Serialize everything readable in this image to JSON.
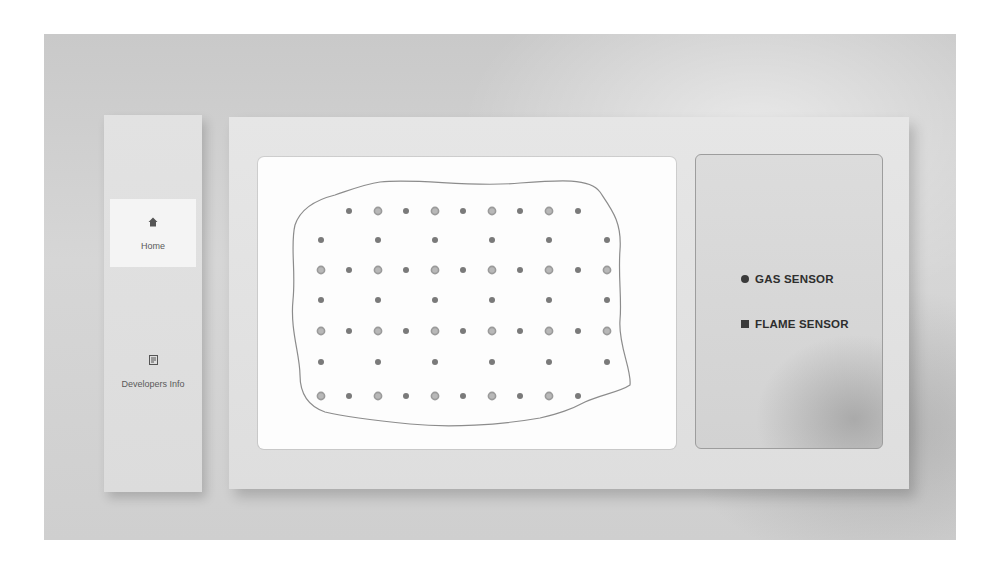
{
  "sidebar": {
    "items": [
      {
        "label": "Home",
        "icon": "home-icon",
        "glyph": "⌂",
        "active": true
      },
      {
        "label": "Developers Info",
        "icon": "document-icon",
        "glyph": "≡",
        "active": false
      }
    ]
  },
  "map": {
    "title": "",
    "boundary_color": "#8c8c8c",
    "gas_sensor_color": "#9a9a9a",
    "flame_sensor_color": "#7a7a7a",
    "rows": [
      {
        "y": 211,
        "sensors": [
          [
            "flame",
            349
          ],
          [
            "gas",
            378
          ],
          [
            "flame",
            406
          ],
          [
            "gas",
            435
          ],
          [
            "flame",
            463
          ],
          [
            "gas",
            492
          ],
          [
            "flame",
            520
          ],
          [
            "gas",
            549
          ],
          [
            "flame",
            578
          ]
        ]
      },
      {
        "y": 240,
        "sensors": [
          [
            "flame",
            321
          ],
          [
            "flame",
            378
          ],
          [
            "flame",
            435
          ],
          [
            "flame",
            492
          ],
          [
            "flame",
            549
          ],
          [
            "flame",
            607
          ]
        ]
      },
      {
        "y": 270,
        "sensors": [
          [
            "gas",
            321
          ],
          [
            "flame",
            349
          ],
          [
            "gas",
            378
          ],
          [
            "flame",
            406
          ],
          [
            "gas",
            435
          ],
          [
            "flame",
            463
          ],
          [
            "gas",
            492
          ],
          [
            "flame",
            520
          ],
          [
            "gas",
            549
          ],
          [
            "flame",
            578
          ],
          [
            "gas",
            607
          ]
        ]
      },
      {
        "y": 300,
        "sensors": [
          [
            "flame",
            321
          ],
          [
            "flame",
            378
          ],
          [
            "flame",
            435
          ],
          [
            "flame",
            492
          ],
          [
            "flame",
            549
          ],
          [
            "flame",
            607
          ]
        ]
      },
      {
        "y": 331,
        "sensors": [
          [
            "gas",
            321
          ],
          [
            "flame",
            349
          ],
          [
            "gas",
            378
          ],
          [
            "flame",
            406
          ],
          [
            "gas",
            435
          ],
          [
            "flame",
            463
          ],
          [
            "gas",
            492
          ],
          [
            "flame",
            520
          ],
          [
            "gas",
            549
          ],
          [
            "flame",
            578
          ],
          [
            "gas",
            607
          ]
        ]
      },
      {
        "y": 362,
        "sensors": [
          [
            "flame",
            321
          ],
          [
            "flame",
            378
          ],
          [
            "flame",
            435
          ],
          [
            "flame",
            492
          ],
          [
            "flame",
            549
          ],
          [
            "flame",
            607
          ]
        ]
      },
      {
        "y": 396,
        "sensors": [
          [
            "gas",
            321
          ],
          [
            "flame",
            349
          ],
          [
            "gas",
            378
          ],
          [
            "flame",
            406
          ],
          [
            "gas",
            435
          ],
          [
            "flame",
            463
          ],
          [
            "gas",
            492
          ],
          [
            "flame",
            520
          ],
          [
            "gas",
            549
          ],
          [
            "flame",
            578
          ]
        ]
      }
    ]
  },
  "legend": {
    "items": [
      {
        "label": "GAS SENSOR",
        "shape": "circle"
      },
      {
        "label": "FLAME SENSOR",
        "shape": "square"
      }
    ]
  }
}
